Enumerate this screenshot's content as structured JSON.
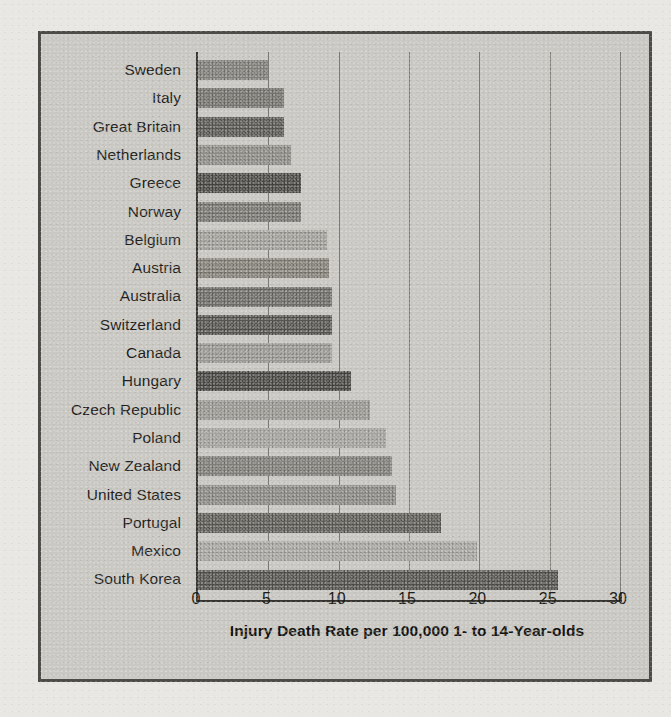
{
  "chart_data": {
    "type": "bar",
    "orientation": "horizontal",
    "title": "",
    "xlabel": "Injury Death Rate per 100,000 1- to 14-Year-olds",
    "ylabel": "",
    "xlim": [
      0,
      30
    ],
    "xticks": [
      0,
      5,
      10,
      15,
      20,
      25,
      30
    ],
    "grid": "vertical",
    "legend": "none",
    "categories": [
      "Sweden",
      "Italy",
      "Great Britain",
      "Netherlands",
      "Greece",
      "Norway",
      "Belgium",
      "Austria",
      "Australia",
      "Switzerland",
      "Canada",
      "Hungary",
      "Czech Republic",
      "Poland",
      "New Zealand",
      "United States",
      "Portugal",
      "Mexico",
      "South Korea"
    ],
    "values": [
      5.0,
      6.1,
      6.1,
      6.6,
      7.3,
      7.3,
      9.2,
      9.3,
      9.5,
      9.5,
      9.5,
      10.9,
      12.2,
      13.4,
      13.8,
      14.1,
      17.3,
      19.8,
      25.6
    ],
    "bar_colors": [
      "#807e78",
      "#75736d",
      "#5a5852",
      "#8e8c86",
      "#4a4844",
      "#7a7872",
      "#a3a19b",
      "#838178",
      "#6e6c66",
      "#56544e",
      "#9b9993",
      "#494743",
      "#9a9892",
      "#a5a39d",
      "#807e78",
      "#8c8a84",
      "#5e5c56",
      "#a9a7a1",
      "#55534d"
    ]
  },
  "axis": {
    "tick_labels": [
      "0",
      "5",
      "10",
      "15",
      "20",
      "25",
      "30"
    ],
    "title": "Injury Death Rate per 100,000 1- to 14-Year-olds"
  },
  "colors": {
    "page_background": "#e8e7e3",
    "panel_background": "#c9c8c3",
    "panel_border": "#4c4b48",
    "axis_line": "#35342f",
    "gridline": "#6d6c66",
    "text": "#1f1e1c"
  }
}
